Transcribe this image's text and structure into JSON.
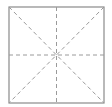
{
  "diagram": {
    "type": "square-with-guides",
    "square": {
      "x": 9,
      "y": 7,
      "width": 95,
      "height": 96,
      "stroke": "#8a8a8a"
    },
    "guides": {
      "stroke": "#9a9a9a",
      "dash": "4,3",
      "lines": [
        "vertical-center",
        "horizontal-center",
        "diagonal-tl-br",
        "diagonal-tr-bl"
      ]
    }
  }
}
